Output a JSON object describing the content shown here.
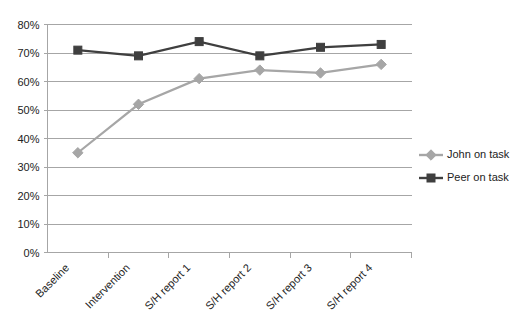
{
  "chart_data": {
    "type": "line",
    "title": "",
    "xlabel": "",
    "ylabel": "",
    "categories": [
      "Baseline",
      "Intervention",
      "S/H report 1",
      "S/H report 2",
      "S/H report 3",
      "S/H report 4"
    ],
    "series": [
      {
        "name": "John on task",
        "color": "#a6a6a6",
        "marker": "diamond",
        "values": [
          35,
          52,
          61,
          64,
          63,
          66
        ]
      },
      {
        "name": "Peer on task",
        "color": "#3f3f3f",
        "marker": "square",
        "values": [
          71,
          69,
          74,
          69,
          72,
          73
        ]
      }
    ],
    "ylim": [
      0,
      80
    ],
    "ytick_values": [
      0,
      10,
      20,
      30,
      40,
      50,
      60,
      70,
      80
    ],
    "ytick_labels": [
      "0%",
      "10%",
      "20%",
      "30%",
      "40%",
      "50%",
      "60%",
      "70%",
      "80%"
    ],
    "grid": true,
    "grid_axis": "y",
    "legend_position": "right",
    "x_tick_label_rotation": -45,
    "value_suffix": "%"
  },
  "legend": {
    "entries": [
      {
        "label": "John on task",
        "color": "#a6a6a6",
        "marker": "diamond"
      },
      {
        "label": "Peer on task",
        "color": "#3f3f3f",
        "marker": "square"
      }
    ]
  },
  "axes": {
    "y_tick_labels": [
      "80%",
      "70%",
      "60%",
      "50%",
      "40%",
      "30%",
      "20%",
      "10%",
      "0%"
    ],
    "x_tick_labels": [
      "Baseline",
      "Intervention",
      "S/H report 1",
      "S/H report 2",
      "S/H report 3",
      "S/H report 4"
    ]
  }
}
